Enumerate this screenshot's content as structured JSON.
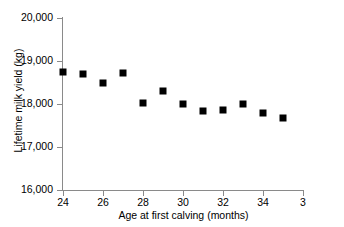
{
  "chart_data": {
    "type": "scatter",
    "title": "",
    "xlabel": "Age at first calving (months)",
    "ylabel": "Lifetime milk yield (kg)",
    "xlim": [
      24,
      36
    ],
    "ylim": [
      16000,
      20000
    ],
    "xticks": [
      24,
      26,
      28,
      30,
      32,
      34,
      36
    ],
    "xtick_labels": [
      "24",
      "26",
      "28",
      "30",
      "32",
      "34",
      "3­"
    ],
    "yticks": [
      16000,
      17000,
      18000,
      19000,
      20000
    ],
    "ytick_labels": [
      "16,000",
      "17,000",
      "18,000",
      "19,000",
      "20,000"
    ],
    "grid": false,
    "legend": false,
    "marker_style": "filled-square",
    "marker_color": "#000000",
    "x": [
      24,
      25,
      26,
      27,
      28,
      29,
      30,
      31,
      32,
      33,
      34,
      35
    ],
    "values": [
      18750,
      18690,
      18480,
      18730,
      18020,
      18300,
      17990,
      17840,
      17860,
      18010,
      17780,
      17670
    ],
    "points": [
      {
        "x": 24,
        "y": 18750
      },
      {
        "x": 25,
        "y": 18690
      },
      {
        "x": 26,
        "y": 18480
      },
      {
        "x": 27,
        "y": 18730
      },
      {
        "x": 28,
        "y": 18020
      },
      {
        "x": 29,
        "y": 18300
      },
      {
        "x": 30,
        "y": 17990
      },
      {
        "x": 31,
        "y": 17840
      },
      {
        "x": 32,
        "y": 17860
      },
      {
        "x": 33,
        "y": 18010
      },
      {
        "x": 34,
        "y": 17780
      },
      {
        "x": 35,
        "y": 17670
      }
    ]
  }
}
